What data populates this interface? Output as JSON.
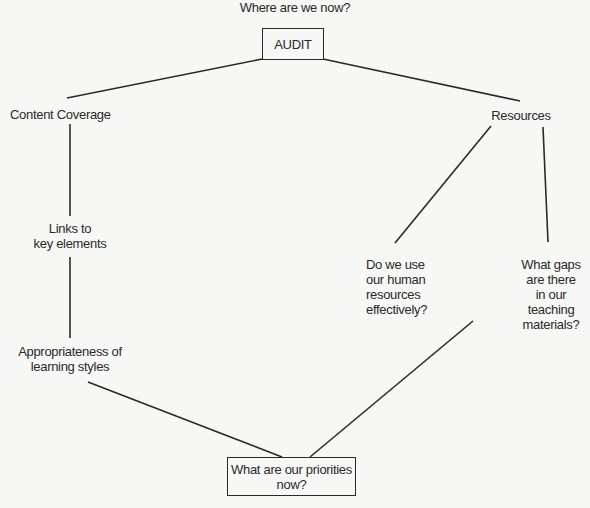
{
  "diagram": {
    "header_question": "Where are we now?",
    "root": {
      "label": "AUDIT"
    },
    "branches": {
      "content_coverage": {
        "label": "Content Coverage",
        "children": [
          {
            "label": "Links to\nkey elements"
          },
          {
            "label": "Appropriateness of\nlearning styles"
          }
        ]
      },
      "resources": {
        "label": "Resources",
        "children": [
          {
            "label": "Do we use\nour human\nresources\neffectively?"
          },
          {
            "label": "What gaps\nare there\nin our\nteaching\nmaterials?"
          }
        ]
      }
    },
    "outcome": {
      "label": "What are our priorities\nnow?"
    }
  },
  "colors": {
    "background": "#f7f7f5",
    "line": "#2a2a2a",
    "text": "#2a2a2a"
  }
}
